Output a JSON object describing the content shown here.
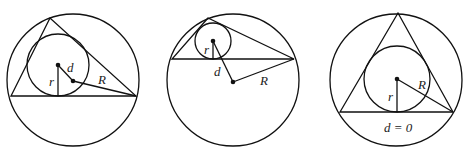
{
  "figure": {
    "colors": {
      "line": "#111111",
      "text": "#222222",
      "background": "#ffffff"
    },
    "panels": [
      {
        "id": "acute-scalene",
        "labels": {
          "d": "d",
          "r": "r",
          "R": "R"
        }
      },
      {
        "id": "obtuse",
        "labels": {
          "d": "d",
          "r": "r",
          "R": "R"
        }
      },
      {
        "id": "equilateral",
        "labels": {
          "r": "r",
          "R": "R",
          "d_eq": "d = 0"
        }
      }
    ]
  }
}
